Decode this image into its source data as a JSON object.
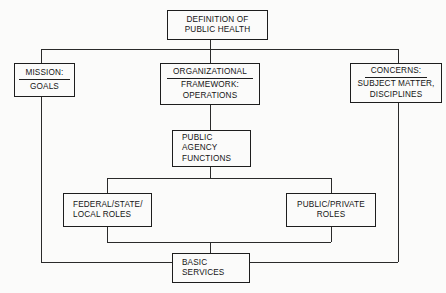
{
  "diagram": {
    "line_color": "#2a2a2a",
    "box_border_color": "#1d1d1d",
    "background_color": "#fbfbfa",
    "text_color": "#141414"
  },
  "nodes": {
    "definition": {
      "lines": [
        "DEFINITION OF",
        "PUBLIC HEALTH"
      ]
    },
    "mission": {
      "header": "MISSION:",
      "lines": [
        "GOALS"
      ]
    },
    "organizational": {
      "header": "ORGANIZATIONAL",
      "lines": [
        "FRAMEWORK:",
        "OPERATIONS"
      ]
    },
    "concerns": {
      "header": "CONCERNS:",
      "lines": [
        "SUBJECT MATTER,",
        "DISCIPLINES"
      ]
    },
    "agency_functions": {
      "lines": [
        "PUBLIC",
        "AGENCY",
        "FUNCTIONS"
      ]
    },
    "federal_state_local": {
      "lines": [
        "FEDERAL/STATE/",
        "LOCAL ROLES"
      ]
    },
    "public_private": {
      "lines": [
        "PUBLIC/PRIVATE",
        "ROLES"
      ]
    },
    "basic_services": {
      "lines": [
        "BASIC",
        "SERVICES"
      ]
    }
  }
}
